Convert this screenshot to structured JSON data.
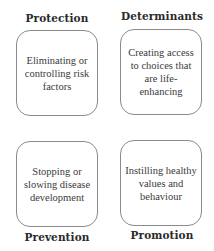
{
  "quadrants": [
    {
      "title": "Protection",
      "title_position": "top",
      "text": "Eliminating or controlling risk factors"
    },
    {
      "title": "Determinants",
      "title_position": "top",
      "text": "Creating access to choices that are life-enhancing"
    },
    {
      "title": "Prevention",
      "title_position": "bottom",
      "text": "Stopping or slowing disease development"
    },
    {
      "title": "Promotion",
      "title_position": "bottom",
      "text": "Instilling healthy values and behaviour"
    }
  ]
}
